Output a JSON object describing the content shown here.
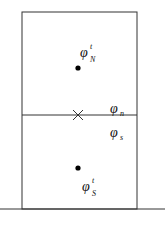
{
  "diagram": {
    "type": "two-cell control volume",
    "cells": [
      {
        "name": "N",
        "label": {
          "base": "φ",
          "sup": "t",
          "sub": "N"
        }
      },
      {
        "name": "S",
        "label": {
          "base": "φ",
          "sup": "t",
          "sub": "S"
        }
      }
    ],
    "face_labels": {
      "north_side": {
        "base": "φ",
        "sub": "n"
      },
      "south_side": {
        "base": "φ",
        "sub": "s"
      }
    },
    "markers": {
      "cell_centers": "filled-dot",
      "face_center": "cross"
    },
    "colors": {
      "line": "#333333",
      "dot": "#000000",
      "background": "#ffffff"
    }
  }
}
